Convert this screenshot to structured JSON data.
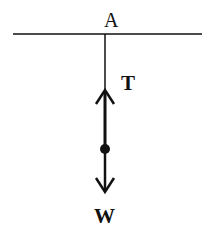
{
  "diagram": {
    "type": "free-body-diagram",
    "labels": {
      "point": "A",
      "tension": "T",
      "weight": "W"
    },
    "elements": {
      "ceiling": {
        "x1": 13,
        "x2": 202,
        "y": 34
      },
      "string": {
        "x": 105,
        "y1": 34,
        "y2": 149
      },
      "mass_point": {
        "cx": 105,
        "cy": 149,
        "r": 5
      },
      "tension_arrow": {
        "from_y": 149,
        "tip_y": 89,
        "direction": "up"
      },
      "weight_arrow": {
        "from_y": 149,
        "tip_y": 193,
        "direction": "down"
      }
    },
    "colors": {
      "stroke": "#111111",
      "background": "#ffffff"
    }
  }
}
